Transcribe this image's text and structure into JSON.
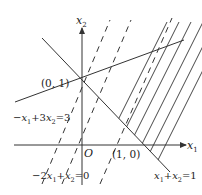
{
  "diagram": {
    "type": "linear-programming-feasible-region",
    "axes": {
      "x_label": "x",
      "x_sub": "1",
      "y_label": "x",
      "y_sub": "2",
      "origin_label": "O"
    },
    "points": [
      {
        "label": "(0, 1)",
        "x": 0,
        "y": 1
      },
      {
        "label": "(1, 0)",
        "x": 1,
        "y": 0
      }
    ],
    "lines": [
      {
        "label_parts": [
          "x",
          "1",
          "+",
          "x",
          "2",
          "=1"
        ],
        "text": "x1+x2=1",
        "style": "solid"
      },
      {
        "label_parts": [
          "−",
          "x",
          "1",
          "+3",
          "x",
          "2",
          "=3"
        ],
        "text": "−x1+3x2=3",
        "style": "solid"
      },
      {
        "label_parts": [
          "−2",
          "x",
          "1",
          "+",
          "x",
          "2",
          "=0"
        ],
        "text": "−2x1+x2=0",
        "style": "dashed"
      }
    ],
    "region": "hatched area to the right of x1+x2=1 with lines parallel to −2x1+x2=0",
    "colors": {
      "stroke": "#333333",
      "background": "#ffffff"
    }
  }
}
